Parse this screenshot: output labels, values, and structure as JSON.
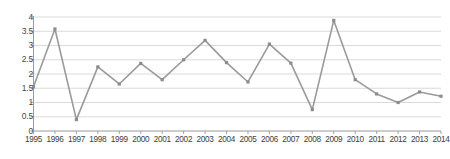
{
  "chart_data": {
    "type": "line",
    "title": "",
    "subtitle": "",
    "xlabel": "",
    "ylabel": "",
    "categories": [
      "1995",
      "1996",
      "1997",
      "1998",
      "1999",
      "2000",
      "2001",
      "2002",
      "2003",
      "2004",
      "2005",
      "2006",
      "2007",
      "2008",
      "2009",
      "2010",
      "2011",
      "2012",
      "2013",
      "2014"
    ],
    "values": [
      1.55,
      3.58,
      0.4,
      2.25,
      1.65,
      2.37,
      1.8,
      2.5,
      3.18,
      2.4,
      1.72,
      3.05,
      2.38,
      0.75,
      3.88,
      1.8,
      1.3,
      1.0,
      1.37,
      1.22
    ],
    "series": [
      {
        "name": "series-1",
        "values": [
          1.55,
          3.58,
          0.4,
          2.25,
          1.65,
          2.37,
          1.8,
          2.5,
          3.18,
          2.4,
          1.72,
          3.05,
          2.38,
          0.75,
          3.88,
          1.8,
          1.3,
          1.0,
          1.37,
          1.22
        ]
      }
    ],
    "ylim": [
      0,
      4
    ],
    "xlim": [
      "1995",
      "2014"
    ],
    "ytick_labels": [
      "0",
      "0.5",
      "1",
      "1.5",
      "2",
      "2.5",
      "3",
      "3.5",
      "4"
    ],
    "ytick_values": [
      0,
      0.5,
      1,
      1.5,
      2,
      2.5,
      3,
      3.5,
      4
    ],
    "xtick_labels": [
      "1995",
      "1996",
      "1997",
      "1998",
      "1999",
      "2000",
      "2001",
      "2002",
      "2003",
      "2004",
      "2005",
      "2006",
      "2007",
      "2008",
      "2009",
      "2010",
      "2011",
      "2012",
      "2013",
      "2014"
    ],
    "grid": true,
    "grid_axis": "y",
    "legend": false,
    "legend_position": "none",
    "annotations": [],
    "colors": {
      "line": "#9a9a9a",
      "marker": "#8c8c8c",
      "grid": "#d6d6d6",
      "axis": "#9a9a9a",
      "tick_text": "#3d3d3d",
      "background": "#ffffff"
    }
  }
}
